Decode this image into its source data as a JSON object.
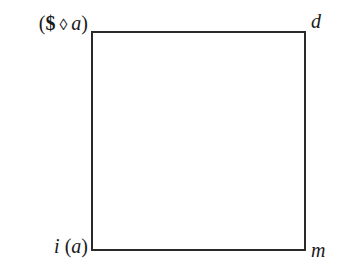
{
  "diagram": {
    "type": "square",
    "corners": {
      "top_left": {
        "label": "($ ◊ a)",
        "parts": {
          "open": "(",
          "symbol": "$",
          "diamond": "◊",
          "var": "a",
          "close": ")"
        }
      },
      "top_right": {
        "label": "d"
      },
      "bottom_left": {
        "label": "i (a)",
        "parts": {
          "func": "i",
          "open": "(",
          "var": "a",
          "close": ")"
        }
      },
      "bottom_right": {
        "label": "m"
      }
    },
    "line_color": "#2a2a2a"
  }
}
